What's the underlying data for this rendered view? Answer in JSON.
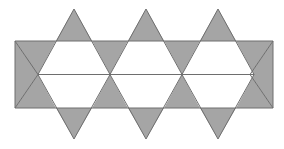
{
  "figure": {
    "type": "geometric-diagram",
    "shape_name": "star-of-david-strip",
    "background_color": "#ffffff",
    "fill_color": "#a5a5a5",
    "stroke_color": "#6e6e6e",
    "stroke_width": 1,
    "canvas": {
      "width": 284,
      "height": 149
    },
    "star_count": 3,
    "geometry": {
      "band_top_y": 41,
      "band_bottom_y": 108,
      "band_height": 67,
      "apex_top_y": 9,
      "apex_bottom_y": 139,
      "star_pitch_x": 72,
      "star_centers_x": [
        74,
        146,
        218
      ],
      "left_edge_x": 15,
      "right_edge_x": 273,
      "crossing_points_x": [
        38,
        109,
        181,
        250
      ],
      "crossing_points_y": 74.5
    },
    "shapes": {
      "upward_triangles": [
        {
          "name": "up-triangle-1",
          "points": "74,9 110,74.5 38,74.5"
        },
        {
          "name": "up-triangle-2",
          "points": "146,9 182,74.5 110,74.5"
        },
        {
          "name": "up-triangle-3",
          "points": "218,9 254,74.5 182,74.5"
        },
        {
          "name": "up-triangle-left-half",
          "points": "38,74.5 15,74.5 26.5,54"
        },
        {
          "name": "up-triangle-right-half",
          "points": "254,74.5 273,74.5 263.5,57"
        }
      ],
      "downward_triangles": [
        {
          "name": "down-triangle-1",
          "points": "74,139 38,74.5 110,74.5"
        },
        {
          "name": "down-triangle-2",
          "points": "146,139 110,74.5 182,74.5"
        },
        {
          "name": "down-triangle-3",
          "points": "218,139 182,74.5 254,74.5"
        }
      ],
      "band_polygons": [
        {
          "name": "left-upper-wing",
          "points": "15,41 74,41 38,74.5"
        },
        {
          "name": "left-lower-wing",
          "points": "15,108 74,108 38,74.5"
        },
        {
          "name": "mid1-upper-wing",
          "points": "74,41 146,41 110,74.5"
        },
        {
          "name": "mid1-lower-wing",
          "points": "74,108 146,108 110,74.5"
        },
        {
          "name": "mid2-upper-wing",
          "points": "146,41 218,41 182,74.5"
        },
        {
          "name": "mid2-lower-wing",
          "points": "146,108 218,108 182,74.5"
        },
        {
          "name": "right-upper-wing",
          "points": "218,41 273,41 250,74.5"
        },
        {
          "name": "right-lower-wing",
          "points": "218,108 273,108 250,74.5"
        }
      ],
      "point_triangles_top": [
        {
          "name": "top-point-1",
          "points": "74,9 92,41 56,41"
        },
        {
          "name": "top-point-2",
          "points": "146,9 164,41 128,41"
        },
        {
          "name": "top-point-3",
          "points": "218,9 236,41 200,41"
        }
      ],
      "point_triangles_bottom": [
        {
          "name": "bottom-point-1",
          "points": "74,139 56,108 92,108"
        },
        {
          "name": "bottom-point-2",
          "points": "146,139 128,108 164,108"
        },
        {
          "name": "bottom-point-3",
          "points": "218,139 200,108 236,108"
        }
      ],
      "white_hexagons": [
        {
          "name": "hexagon-1",
          "points": "56,41 92,41 110,74.5 92,108 56,108 38,74.5"
        },
        {
          "name": "hexagon-2",
          "points": "128,41 164,41 182,74.5 164,108 128,108 110,74.5"
        },
        {
          "name": "hexagon-3",
          "points": "200,41 236,41 254,74.5 236,108 200,108 182,74.5"
        }
      ]
    }
  }
}
